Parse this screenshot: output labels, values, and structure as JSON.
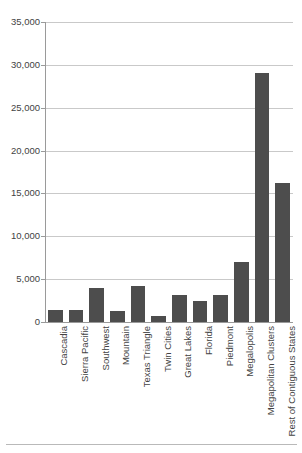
{
  "chart_data": {
    "type": "bar",
    "title": "",
    "subtitle": "",
    "xlabel": "",
    "ylabel": "",
    "ylim": [
      0,
      35000
    ],
    "ytick_step": 5000,
    "grid": true,
    "legend": false,
    "legend_position": "none",
    "bar_color": "#4d4d4d",
    "grid_color": "#c9c9c9",
    "axis_color": "#9a9a9a",
    "categories": [
      "Cascadia",
      "Sierra Pacific",
      "Southwest",
      "Mountain",
      "Texas Triangle",
      "Twin Cities",
      "Great Lakes",
      "Florida",
      "Piedmont",
      "Megalopolis",
      "Megapolitan Clusters",
      "Rest of Contiguous States"
    ],
    "values": [
      1400,
      1350,
      4000,
      1300,
      4250,
      700,
      3100,
      2450,
      3100,
      7000,
      29000,
      16200
    ],
    "ytick_labels": [
      "0",
      "5,000",
      "10,000",
      "15,000",
      "20,000",
      "25,000",
      "30,000",
      "35,000"
    ],
    "ytick_values": [
      0,
      5000,
      10000,
      15000,
      20000,
      25000,
      30000,
      35000
    ]
  }
}
